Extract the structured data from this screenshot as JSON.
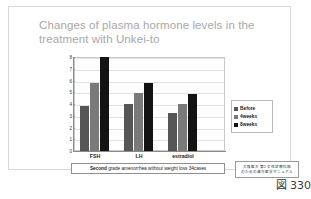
{
  "slide": {
    "title": "Changes of plasma hormone levels in the treatment with Unkei-to",
    "caption_bold": "Second",
    "caption_rest": " grade amenorrhea without weight loss 34cases",
    "source_line1": "大阪医大 第2 女性診療科部",
    "source_line2": "のための漢方医学マニュアル",
    "figure_number": "図 330"
  },
  "chart_data": {
    "type": "bar",
    "title": "Changes of plasma hormone levels in the treatment with Unkei-to",
    "categories": [
      "FSH",
      "LH",
      "estradiol"
    ],
    "series": [
      {
        "name": "Before",
        "values": [
          3.8,
          4.0,
          3.2
        ],
        "color": "#565656"
      },
      {
        "name": "4weeks",
        "values": [
          5.8,
          4.9,
          4.0
        ],
        "color": "#7a7a7a"
      },
      {
        "name": "8weeks",
        "values": [
          8.0,
          5.8,
          4.85
        ],
        "color": "#131313"
      }
    ],
    "xlabel": "",
    "ylabel": "",
    "ylim": [
      0,
      8
    ],
    "yticks": [
      0,
      1,
      2,
      3,
      4,
      5,
      6,
      7,
      8
    ],
    "grid": true,
    "legend_position": "right"
  }
}
